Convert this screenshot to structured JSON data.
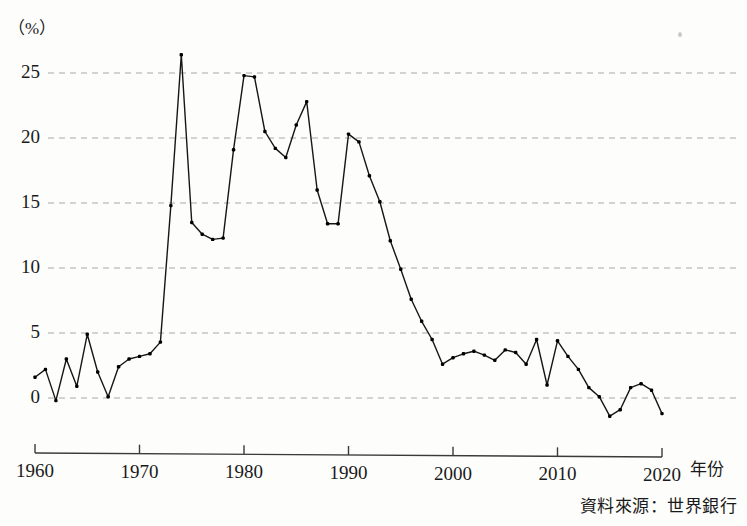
{
  "meta": {
    "unit_label": "（%）",
    "source_note": "資料來源：世界銀行",
    "xaxis_title": "年份"
  },
  "chart_data": {
    "type": "line",
    "title": "",
    "subtitle": "",
    "xlabel": "年份",
    "ylabel": "（%）",
    "xlim": [
      1960,
      2020
    ],
    "ylim": [
      -3,
      28
    ],
    "grid": "horizontal-dashed",
    "legend": "none",
    "marker": "dot",
    "yticks": [
      0,
      5,
      10,
      15,
      20,
      25
    ],
    "ytick_labels": [
      "0",
      "5",
      "10",
      "15",
      "20",
      "25"
    ],
    "xticks": [
      1960,
      1970,
      1980,
      1990,
      2000,
      2010,
      2020
    ],
    "xtick_labels": [
      "1960",
      "1970",
      "1980",
      "1990",
      "2000",
      "2010",
      "2020"
    ],
    "x": [
      1960,
      1961,
      1962,
      1963,
      1964,
      1965,
      1966,
      1967,
      1968,
      1969,
      1970,
      1971,
      1972,
      1973,
      1974,
      1975,
      1976,
      1977,
      1978,
      1979,
      1980,
      1981,
      1982,
      1983,
      1984,
      1985,
      1986,
      1987,
      1988,
      1989,
      1990,
      1991,
      1992,
      1993,
      1994,
      1995,
      1996,
      1997,
      1998,
      1999,
      2000,
      2001,
      2002,
      2003,
      2004,
      2005,
      2006,
      2007,
      2008,
      2009,
      2010,
      2011,
      2012,
      2013,
      2014,
      2015,
      2016,
      2017,
      2018,
      2019,
      2020
    ],
    "values": [
      1.6,
      2.2,
      -0.2,
      3.0,
      0.9,
      4.9,
      2.0,
      0.1,
      2.4,
      3.0,
      3.2,
      3.4,
      4.3,
      14.8,
      26.4,
      13.5,
      12.6,
      12.2,
      12.3,
      19.1,
      24.8,
      24.7,
      20.5,
      19.2,
      18.5,
      21.0,
      22.8,
      16.0,
      13.4,
      13.4,
      20.3,
      19.7,
      17.1,
      15.1,
      12.1,
      9.9,
      7.6,
      5.9,
      4.5,
      2.6,
      3.1,
      3.4,
      3.6,
      3.3,
      2.9,
      3.7,
      3.5,
      2.6,
      4.5,
      1.0,
      4.4,
      3.2,
      2.2,
      0.8,
      0.1,
      -1.4,
      -0.9,
      0.8,
      1.1,
      0.6,
      -1.2
    ],
    "series": [
      {
        "name": "通貨膨脹率",
        "values": [
          1.6,
          2.2,
          -0.2,
          3.0,
          0.9,
          4.9,
          2.0,
          0.1,
          2.4,
          3.0,
          3.2,
          3.4,
          4.3,
          14.8,
          26.4,
          13.5,
          12.6,
          12.2,
          12.3,
          19.1,
          24.8,
          24.7,
          20.5,
          19.2,
          18.5,
          21.0,
          22.8,
          16.0,
          13.4,
          13.4,
          20.3,
          19.7,
          17.1,
          15.1,
          12.1,
          9.9,
          7.6,
          5.9,
          4.5,
          2.6,
          3.1,
          3.4,
          3.6,
          3.3,
          2.9,
          3.7,
          3.5,
          2.6,
          4.5,
          1.0,
          4.4,
          3.2,
          2.2,
          0.8,
          0.1,
          -1.4,
          -0.9,
          0.8,
          1.1,
          0.6,
          -1.2
        ]
      }
    ],
    "colors": {
      "line": "#161616",
      "grid": "#a8a8a8",
      "axis": "#3a3a3a",
      "marker": "#000000"
    }
  }
}
